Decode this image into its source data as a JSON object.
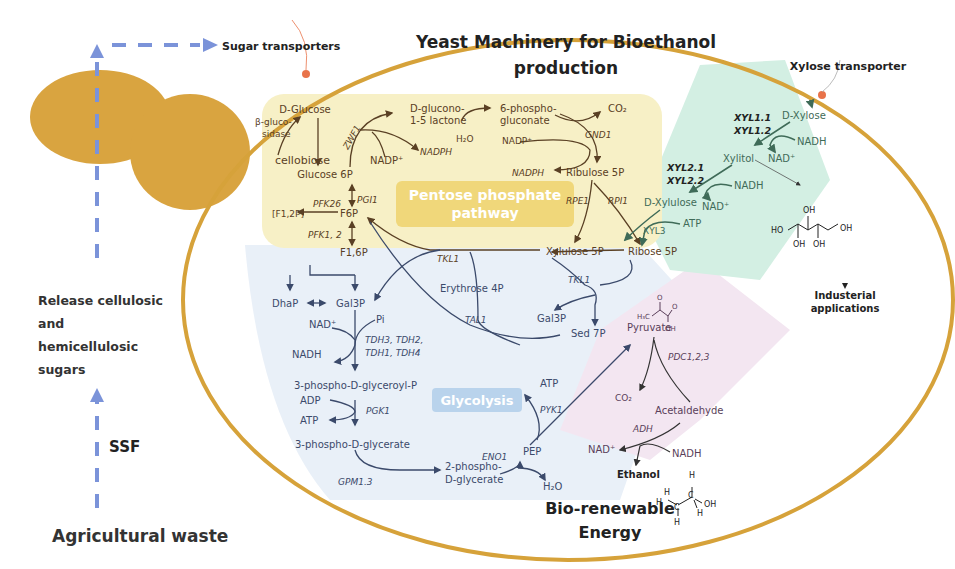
{
  "title": {
    "line1": "Yeast Machinery for Bioethanol",
    "line2": "production"
  },
  "external": {
    "sugar_transporters": "Sugar transporters",
    "xylose_transporter": "Xylose transporter",
    "release_sugars": [
      "Release cellulosic",
      "and",
      "hemicellulosic",
      "sugars"
    ],
    "ssf": "SSF",
    "agricultural_waste": "Agricultural waste",
    "bio_renewable": [
      "Bio-renewable",
      "Energy"
    ],
    "industrial_applications": [
      "Industerial",
      "applications"
    ]
  },
  "regions": {
    "pentose_phosphate": [
      "Pentose phosphate",
      "pathway"
    ],
    "glycolysis": "Glycolysis",
    "xylose_pathway": "Xylose pathway",
    "fermentation": ""
  },
  "colors": {
    "membrane": "#d6a23a",
    "yeast_body": "#d9a440",
    "transporter_dot": "#e8734a",
    "arrow_blue": "#7b93d9",
    "ppp_bg": "#f7f0c6",
    "ppp_label_bg": "#f0d77a",
    "glycolysis_bg": "#e9f0f8",
    "glycolysis_label_bg": "#b9d3ec",
    "xylose_bg": "#d3efe3",
    "ferment_bg": "#f3e6f1"
  },
  "ppp": {
    "d_glucose": "D-Glucose",
    "beta_glucosidase": [
      "β-gluco-",
      "sidase"
    ],
    "cellobiose": "cellobiose",
    "glucose6p": "Glucose 6P",
    "zwf1": "ZWF1",
    "nadp_plus_1": "NADP⁺",
    "nadph_1": "NADPH",
    "d_glucono": [
      "D-glucono-",
      "1-5 lactone"
    ],
    "h2o": "H₂O",
    "phosphogluconate": [
      "6-phospho-",
      "gluconate"
    ],
    "co2": "CO₂",
    "gnd1": "GND1",
    "nadp_plus_2": "NADP⁺",
    "nadph_2": "NADPH",
    "ribulose5p": "Ribulose 5P",
    "rpe1": "RPE1",
    "rpi1": "RPI1",
    "xylulose5p": "Xylulose 5P",
    "ribose5p": "Ribose 5P",
    "pgi1": "PGI1",
    "pfk26": "PFK26",
    "f12p": "[F1,2P]",
    "f6p": "F6P",
    "pfk12": "PFK1, 2",
    "f16p": "F1,6P",
    "tkl1_a": "TKL1"
  },
  "nonox": {
    "erythrose4p": "Erythrose 4P",
    "tal1": "TAL1",
    "tkl1_b": "TKL1",
    "gal3p_b": "Gal3P",
    "sed7p": "Sed 7P"
  },
  "glycolysis": {
    "dhap": "DhaP",
    "gal3p": "Gal3P",
    "nad_plus": "NAD⁺",
    "pi": "Pi",
    "nadh": "NADH",
    "tdh": [
      "TDH3, TDH2,",
      "TDH1, TDH4"
    ],
    "bpg": "3-phospho-D-glyceroyl-P",
    "adp": "ADP",
    "atp1": "ATP",
    "pgk1": "PGK1",
    "pg3": "3-phospho-D-glycerate",
    "gpm": "GPM1.3",
    "pg2": [
      "2-phospho-",
      "D-glycerate"
    ],
    "eno1": "ENO1",
    "pep": "PEP",
    "h2o": "H₂O",
    "pyk1": "PYK1",
    "atp2": "ATP"
  },
  "xylose": {
    "d_xylose": "D-Xylose",
    "xyl11": "XYL1.1",
    "xyl12": "XYL1.2",
    "nadh1": "NADH",
    "nad1": "NAD⁺",
    "xylitol": "Xylitol",
    "xyl21": "XYL2.1",
    "xyl22": "XYL2.2",
    "nadh2": "NADH",
    "nad2": "NAD⁺",
    "d_xylulose": "D-Xylulose",
    "atp": "ATP",
    "xyl3": "XYL3"
  },
  "fermentation": {
    "pyruvate": "Pyruvate",
    "pdc": "PDC1,2,3",
    "co2": "CO₂",
    "acetaldehyde": "Acetaldehyde",
    "adh": "ADH",
    "nad_plus": "NAD⁺",
    "nadh": "NADH",
    "ethanol": "Ethanol"
  }
}
